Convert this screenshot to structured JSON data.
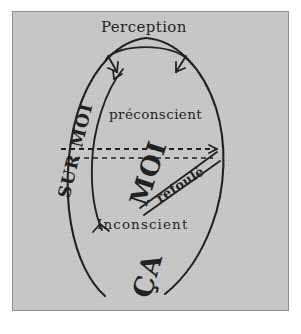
{
  "figure": {
    "type": "diagram",
    "language": "French",
    "background_color": "#c9c9c9",
    "ink_color": "#1a1a1a",
    "border_color": "#8e8e8e",
    "labels": {
      "perception": "Perception",
      "preconscient": "préconscient",
      "inconscient": "Inconscient",
      "sur_moi": "SUR MOI",
      "moi": "MOI",
      "ca": "ÇA",
      "refoule": "refoulé"
    },
    "elements": [
      {
        "name": "egg-outline",
        "shape": "open egg / ovoid outline",
        "closed": false
      },
      {
        "name": "perception-arc",
        "shape": "arc at top of egg"
      },
      {
        "name": "perception-arrow-left",
        "shape": "arrowhead pointing down-right into egg"
      },
      {
        "name": "perception-arrow-right",
        "shape": "arrowhead pointing down-left into egg"
      },
      {
        "name": "sur-moi-band",
        "shape": "crescent band along left side of egg"
      },
      {
        "name": "sur-moi-arrow-top",
        "shape": "arrowhead on inner band curve, upper end"
      },
      {
        "name": "sur-moi-arrow-bottom",
        "shape": "arrowhead on inner band curve, lower end"
      },
      {
        "name": "dashed-line-upper",
        "shape": "horizontal dashed line with right-pointing arrow"
      },
      {
        "name": "dashed-line-lower",
        "shape": "horizontal dashed line"
      },
      {
        "name": "refoule-double-line",
        "shape": "diagonal double line from right edge down-left"
      }
    ]
  }
}
